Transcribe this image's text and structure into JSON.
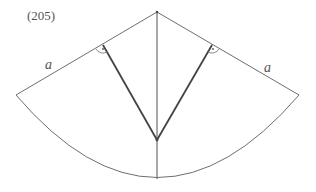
{
  "figure": {
    "number_label": "(205)",
    "side_labels": {
      "left": "a",
      "right": "a"
    },
    "colors": {
      "thin_line": "#6e6e6e",
      "thick_line": "#444444",
      "text": "#555555",
      "background": "#ffffff"
    },
    "points": {
      "apex": [
        157,
        12
      ],
      "left_corner": [
        16,
        95
      ],
      "right_corner": [
        299,
        95
      ],
      "inner_vertex": [
        157,
        140
      ],
      "arc_bottom": [
        157,
        179
      ],
      "left_foot": [
        103,
        45
      ],
      "right_foot": [
        212,
        45
      ]
    },
    "right_angle_marks": 2
  }
}
